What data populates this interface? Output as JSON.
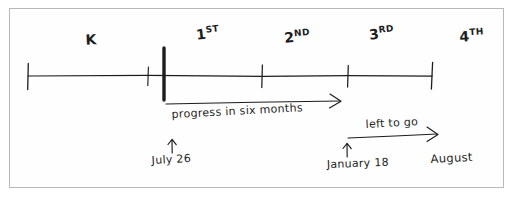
{
  "diagram": {
    "style": "hand-drawn ink sketch on white paper",
    "ink_color": "#1d1d1d",
    "frame_color": "#b9b9b9",
    "background_color": "#ffffff"
  },
  "axis": {
    "name": "grade-timeline-axis",
    "start_x": 28,
    "end_x": 432,
    "y": 76
  },
  "ticks": [
    {
      "id": "tick-start",
      "x": 28,
      "emphasis": "normal"
    },
    {
      "id": "tick-k-end",
      "x": 148,
      "emphasis": "normal"
    },
    {
      "id": "tick-now",
      "x": 164,
      "emphasis": "bold"
    },
    {
      "id": "tick-1st-end",
      "x": 262,
      "emphasis": "normal"
    },
    {
      "id": "tick-2nd-end",
      "x": 348,
      "emphasis": "normal"
    },
    {
      "id": "tick-end",
      "x": 432,
      "emphasis": "normal"
    }
  ],
  "grade_labels": [
    {
      "id": "grade-k",
      "base": "K",
      "ordinal": "",
      "x": 86,
      "y": 45,
      "rotate": -3
    },
    {
      "id": "grade-1st",
      "base": "1",
      "ordinal": "ST",
      "x": 200,
      "y": 40,
      "rotate": -7
    },
    {
      "id": "grade-2nd",
      "base": "2",
      "ordinal": "ND",
      "x": 287,
      "y": 43,
      "rotate": -5
    },
    {
      "id": "grade-3rd",
      "base": "3",
      "ordinal": "RD",
      "x": 372,
      "y": 40,
      "rotate": -7
    },
    {
      "id": "grade-4th",
      "base": "4",
      "ordinal": "TH",
      "x": 462,
      "y": 42,
      "rotate": -4
    }
  ],
  "annotations": {
    "progress_arrow": {
      "id": "progress-arrow",
      "label": "progress in six months",
      "x1": 166,
      "y1": 104,
      "x2": 340,
      "y2": 101,
      "label_x": 172,
      "label_y": 120,
      "label_rotate": -3
    },
    "left_to_go_arrow": {
      "id": "left-to-go-arrow",
      "label": "left to go",
      "x1": 348,
      "y1": 138,
      "x2": 437,
      "y2": 134,
      "label_x": 366,
      "label_y": 130,
      "label_rotate": -3
    },
    "markers": [
      {
        "id": "marker-july",
        "label": "July 26",
        "arrow_x": 172,
        "arrow_top": 140,
        "arrow_bottom": 153,
        "label_x": 153,
        "label_y": 165,
        "label_rotate": -3
      },
      {
        "id": "marker-january",
        "label": "January 18",
        "arrow_x": 347,
        "arrow_top": 144,
        "arrow_bottom": 157,
        "label_x": 328,
        "label_y": 170,
        "label_rotate": -2
      }
    ],
    "end_label": {
      "id": "august-end-label",
      "label": "August",
      "x": 432,
      "y": 163,
      "rotate": -3
    }
  }
}
